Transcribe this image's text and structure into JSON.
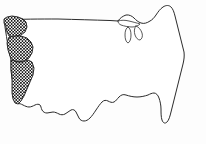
{
  "figure": {
    "width": 206,
    "height": 144
  },
  "style": {
    "background_color": "#fdfdfd",
    "outline_color": "#2b2b2b",
    "interior_fill": "#ffffff",
    "highlight_pattern_color": "#111111",
    "highlight_pattern_name": "checkerboard-halftone",
    "lake_outline_color": "#3a3a3a",
    "outline_stroke_width": 1
  },
  "regions": {
    "base_name": "contiguous-united-states",
    "highlighted": [
      {
        "id": "washington",
        "label": "Washington",
        "filled": true
      },
      {
        "id": "oregon",
        "label": "Oregon",
        "filled": true
      },
      {
        "id": "california",
        "label": "California",
        "filled": true
      }
    ],
    "unfilled_label": "Remaining states",
    "water_features": [
      {
        "id": "great-lakes",
        "label": "Great Lakes"
      }
    ],
    "borders": [
      {
        "id": "canada-border",
        "label": "Northern border"
      },
      {
        "id": "mexico-border",
        "label": "Southern border"
      },
      {
        "id": "atlantic-coast",
        "label": "Atlantic coast"
      },
      {
        "id": "pacific-coast",
        "label": "Pacific coast"
      },
      {
        "id": "gulf-coast",
        "label": "Gulf coast"
      }
    ],
    "landmarks": [
      {
        "id": "florida-peninsula",
        "label": "Florida peninsula"
      },
      {
        "id": "texas-gulf",
        "label": "Texas Gulf coast"
      },
      {
        "id": "new-england",
        "label": "New England coast"
      },
      {
        "id": "michigan-peninsula",
        "label": "Michigan peninsula"
      }
    ]
  }
}
